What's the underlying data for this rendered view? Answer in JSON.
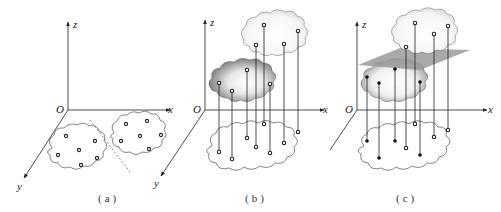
{
  "figure": {
    "panels": [
      {
        "id": "a",
        "caption": "(a)",
        "axes": {
          "origin": "O",
          "z": "z",
          "x": "x",
          "y": "y"
        },
        "description": "Two clusters of points in the xy-plane separated by a dashed line"
      },
      {
        "id": "b",
        "caption": "(b)",
        "axes": {
          "origin": "O",
          "z": "z",
          "x": "x",
          "y": "y"
        },
        "description": "Points lifted into higher dimension (z) forming two separated clouds"
      },
      {
        "id": "c",
        "caption": "(c)",
        "axes": {
          "origin": "O",
          "z": "z",
          "x": "x"
        },
        "description": "Separating plane between lifted clouds; filled and hollow points mark the two classes"
      }
    ],
    "colors": {
      "line": "#222222",
      "plane": "#9a9a9a",
      "dark_cloud": "#7a7a7a",
      "light_cloud": "#f2f2f2"
    }
  }
}
